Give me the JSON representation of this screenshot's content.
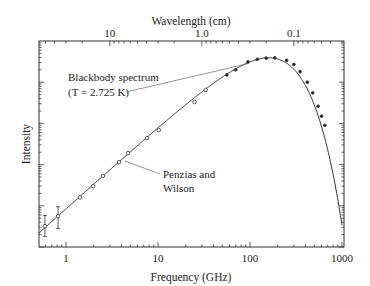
{
  "chart_data": {
    "type": "scatter",
    "title": "",
    "xlabel": "Frequency (GHz)",
    "ylabel": "Intensity",
    "top_xlabel": "Wavelength (cm)",
    "xscale": "log",
    "yscale": "log",
    "xlim": [
      0.51,
      1000
    ],
    "ylim": [
      1,
      100000
    ],
    "x_ticks": [
      {
        "value": 1,
        "label": "1"
      },
      {
        "value": 10,
        "label": "10"
      },
      {
        "value": 100,
        "label": "100"
      },
      {
        "value": 1000,
        "label": "1000"
      }
    ],
    "top_ticks": [
      {
        "value_cm": 10,
        "label": "10"
      },
      {
        "value_cm": 1.0,
        "label": "1.0"
      },
      {
        "value_cm": 0.1,
        "label": "0.1"
      }
    ],
    "y_ticks_labeled": false,
    "grid": false,
    "series": [
      {
        "name": "Blackbody spectrum (T = 2.725 K)",
        "kind": "line",
        "temperature_K": 2.725
      },
      {
        "name": "Measurements",
        "kind": "points",
        "points": [
          {
            "f": 0.59,
            "I": 3.2,
            "err": [
              1.8,
              5.8
            ]
          },
          {
            "f": 0.82,
            "I": 5.6,
            "err": [
              2.8,
              9.5
            ]
          },
          {
            "f": 1.42,
            "I": 16
          },
          {
            "f": 1.97,
            "I": 30
          },
          {
            "f": 2.52,
            "I": 53
          },
          {
            "f": 3.77,
            "I": 115
          },
          {
            "f": 4.72,
            "I": 190
          },
          {
            "f": 7.6,
            "I": 440
          },
          {
            "f": 10.2,
            "I": 690
          },
          {
            "f": 25,
            "I": 3300
          },
          {
            "f": 33,
            "I": 6500
          },
          {
            "f": 56,
            "I": 15000
          },
          {
            "f": 70,
            "I": 20000
          },
          {
            "f": 95,
            "I": 31000
          },
          {
            "f": 120,
            "I": 36000
          },
          {
            "f": 150,
            "I": 38500
          },
          {
            "f": 186,
            "I": 39000
          },
          {
            "f": 250,
            "I": 34000
          },
          {
            "f": 300,
            "I": 27000
          },
          {
            "f": 350,
            "I": 18000
          },
          {
            "f": 420,
            "I": 10000
          },
          {
            "f": 480,
            "I": 5500
          },
          {
            "f": 550,
            "I": 2600
          },
          {
            "f": 600,
            "I": 1500
          },
          {
            "f": 650,
            "I": 900
          }
        ]
      }
    ],
    "annotations": [
      {
        "text_line1": "Blackbody spectrum",
        "text_line2": "(T  =  2.725 K)",
        "points_to_f": 100
      },
      {
        "text_line1": "Penzias and",
        "text_line2": "Wilson",
        "points_to_f": 4.1
      }
    ]
  }
}
